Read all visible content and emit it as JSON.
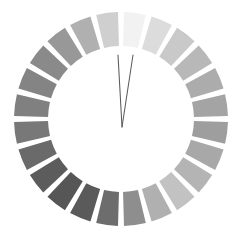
{
  "figure": {
    "background_color": "#ffffff",
    "width": 242,
    "height": 233
  },
  "chart_data": {
    "type": "pie",
    "title": "",
    "subtitle": "",
    "xlabel": "",
    "ylabel": "",
    "grid": false,
    "legend": "none",
    "center_x": 121,
    "center_y": 119,
    "outer_radius": 107,
    "inner_radius": 73,
    "segment_count": 24,
    "segment_gap_degrees": 3.2,
    "start_angle_degrees": -90,
    "categories": [
      "1",
      "2",
      "3",
      "4",
      "5",
      "6",
      "7",
      "8",
      "9",
      "10",
      "11",
      "12",
      "13",
      "14",
      "15",
      "16",
      "17",
      "18",
      "19",
      "20",
      "21",
      "22",
      "23",
      "24"
    ],
    "values": [
      1,
      1,
      1,
      1,
      1,
      1,
      1,
      1,
      1,
      1,
      1,
      1,
      1,
      1,
      1,
      1,
      1,
      1,
      1,
      1,
      1,
      1,
      1,
      1
    ],
    "segments": [
      {
        "index": 1,
        "angle_deg": 0,
        "color": "#f2f2f2",
        "luminance": 242
      },
      {
        "index": 2,
        "angle_deg": 15,
        "color": "#dcdcdc",
        "luminance": 220
      },
      {
        "index": 3,
        "angle_deg": 30,
        "color": "#c9c9c9",
        "luminance": 201
      },
      {
        "index": 4,
        "angle_deg": 45,
        "color": "#b8b8b8",
        "luminance": 184
      },
      {
        "index": 5,
        "angle_deg": 60,
        "color": "#acacac",
        "luminance": 172
      },
      {
        "index": 6,
        "angle_deg": 75,
        "color": "#a4a4a4",
        "luminance": 164
      },
      {
        "index": 7,
        "angle_deg": 90,
        "color": "#9e9e9e",
        "luminance": 158
      },
      {
        "index": 8,
        "angle_deg": 105,
        "color": "#a8a8a8",
        "luminance": 168
      },
      {
        "index": 9,
        "angle_deg": 120,
        "color": "#b4b4b4",
        "luminance": 180
      },
      {
        "index": 10,
        "angle_deg": 135,
        "color": "#c2c2c2",
        "luminance": 194
      },
      {
        "index": 11,
        "angle_deg": 150,
        "color": "#b0b0b0",
        "luminance": 176
      },
      {
        "index": 12,
        "angle_deg": 165,
        "color": "#8e8e8e",
        "luminance": 142
      },
      {
        "index": 13,
        "angle_deg": 180,
        "color": "#6d6d6d",
        "luminance": 109
      },
      {
        "index": 14,
        "angle_deg": 195,
        "color": "#5a5a5a",
        "luminance": 90
      },
      {
        "index": 15,
        "angle_deg": 210,
        "color": "#565656",
        "luminance": 86
      },
      {
        "index": 16,
        "angle_deg": 225,
        "color": "#5c5c5c",
        "luminance": 92
      },
      {
        "index": 17,
        "angle_deg": 240,
        "color": "#6a6a6a",
        "luminance": 106
      },
      {
        "index": 18,
        "angle_deg": 255,
        "color": "#787878",
        "luminance": 120
      },
      {
        "index": 19,
        "angle_deg": 270,
        "color": "#808080",
        "luminance": 128
      },
      {
        "index": 20,
        "angle_deg": 285,
        "color": "#848484",
        "luminance": 132
      },
      {
        "index": 21,
        "angle_deg": 300,
        "color": "#8a8a8a",
        "luminance": 138
      },
      {
        "index": 22,
        "angle_deg": 315,
        "color": "#989898",
        "luminance": 152
      },
      {
        "index": 23,
        "angle_deg": 330,
        "color": "#b0b0b0",
        "luminance": 176
      },
      {
        "index": 24,
        "angle_deg": 345,
        "color": "#cfcfcf",
        "luminance": 207
      }
    ],
    "needles": [
      {
        "name": "needle-left",
        "x1": 118,
        "y1": 55,
        "x2": 122,
        "y2": 127,
        "color": "#5a5a5a"
      },
      {
        "name": "needle-right",
        "x1": 133,
        "y1": 55,
        "x2": 122,
        "y2": 127,
        "color": "#5a5a5a"
      }
    ],
    "annotations": []
  }
}
